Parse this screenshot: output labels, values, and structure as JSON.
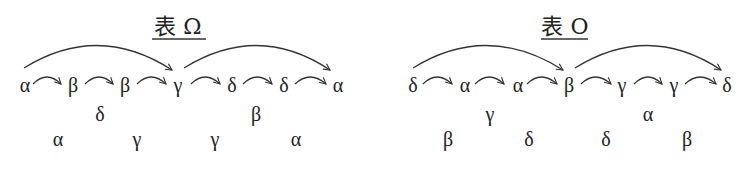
{
  "panels": [
    {
      "title": "表 Ω",
      "main_row": [
        "α",
        "β",
        "β",
        "γ",
        "δ",
        "δ",
        "α"
      ],
      "row2": [
        "δ",
        "β"
      ],
      "row3": [
        "α",
        "γ",
        "γ",
        "α"
      ]
    },
    {
      "title": "表 O",
      "main_row": [
        "δ",
        "α",
        "α",
        "β",
        "γ",
        "γ",
        "δ"
      ],
      "row2": [
        "γ",
        "α"
      ],
      "row3": [
        "β",
        "δ",
        "δ",
        "β"
      ]
    }
  ]
}
